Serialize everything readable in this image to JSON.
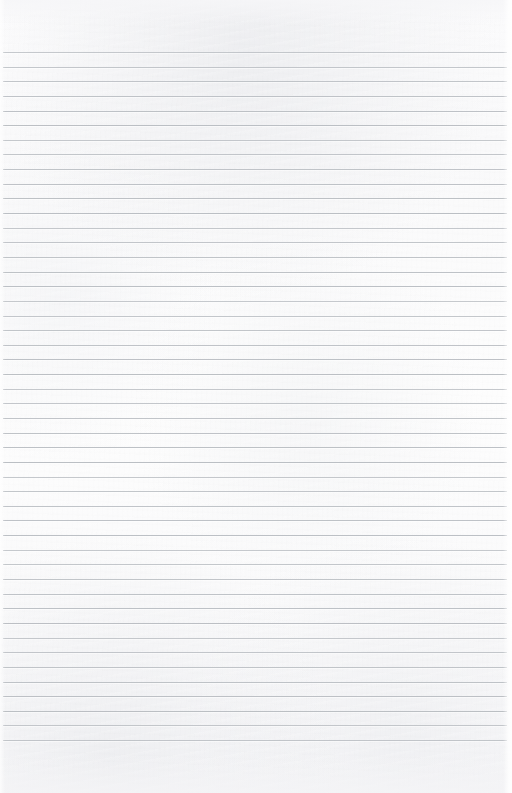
{
  "document": {
    "kind": "scanned-blank-ruled-paper",
    "page_label": "",
    "orientation": "portrait",
    "width_px": 512,
    "height_px": 793,
    "has_text_content": false,
    "handwriting_present": false,
    "printed_text_present": false
  },
  "paper": {
    "background_color": "#f8f8f9",
    "highlight_color": "#fdfdfd",
    "shadow_tone_color": "#e9eaed",
    "texture": "faint mottled scan grain",
    "edge_highlight_color": "#ffffff"
  },
  "ruling": {
    "style": "horizontal-ruled",
    "line_color": "#b9bdc2",
    "line_thickness_px": 1,
    "line_count": 48,
    "first_line_y": 52,
    "last_line_y": 740,
    "line_spacing_px": 14.64,
    "line_start_x": 3,
    "line_end_x": 507,
    "vertical_margin_rule": false,
    "margin_rule_color": ""
  },
  "margins": {
    "top_px": 52,
    "bottom_px": 53,
    "left_px": 3,
    "right_px": 5,
    "top_label": "",
    "bottom_label": ""
  },
  "content": {
    "lines": []
  }
}
